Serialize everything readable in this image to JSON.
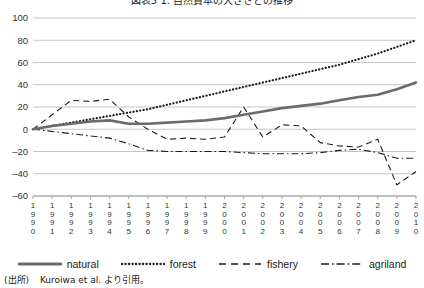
{
  "figure": {
    "title": "図表5  1. 自然資本の大きさとの推移",
    "source_label": "(出所)",
    "source_text": "Kuroiwa et al. より引用。"
  },
  "legend": {
    "position": "bottom",
    "items": [
      {
        "label": "natural",
        "style": "solid",
        "icon": "line-solid-icon"
      },
      {
        "label": "forest",
        "style": "dotted",
        "icon": "line-dotted-icon"
      },
      {
        "label": "fishery",
        "style": "dashed",
        "icon": "line-dashed-icon"
      },
      {
        "label": "agriland",
        "style": "dashdot",
        "icon": "line-dashdot-icon"
      }
    ]
  },
  "chart_data": {
    "type": "line",
    "title": "図表5  1. 自然資本の大きさとの推移",
    "xlabel": "",
    "ylabel": "",
    "ylim": [
      -60,
      100
    ],
    "yticks": [
      100,
      80,
      60,
      40,
      20,
      0,
      -20,
      -40,
      -60
    ],
    "grid": true,
    "legend_position": "bottom",
    "x": [
      1990,
      1991,
      1992,
      1993,
      1994,
      1995,
      1996,
      1997,
      1998,
      1999,
      2000,
      2001,
      2002,
      2003,
      2004,
      2005,
      2006,
      2007,
      2008,
      2009,
      2010
    ],
    "categories": [
      "1990",
      "1991",
      "1992",
      "1993",
      "1994",
      "1995",
      "1996",
      "1997",
      "1998",
      "1999",
      "2000",
      "2001",
      "2002",
      "2003",
      "2004",
      "2005",
      "2006",
      "2007",
      "2008",
      "2009",
      "2010"
    ],
    "series": [
      {
        "name": "natural",
        "values": [
          0,
          3,
          5,
          7,
          8,
          5,
          5,
          6,
          7,
          8,
          10,
          13,
          16,
          19,
          21,
          23,
          26,
          29,
          31,
          36,
          42
        ]
      },
      {
        "name": "forest",
        "values": [
          0,
          3,
          6,
          9,
          12,
          15,
          18,
          22,
          26,
          30,
          34,
          38,
          42,
          46,
          50,
          54,
          58,
          63,
          68,
          74,
          80
        ]
      },
      {
        "name": "fishery",
        "values": [
          0,
          13,
          26,
          25,
          27,
          11,
          0,
          -9,
          -8,
          -9,
          -7,
          20,
          -7,
          4,
          3,
          -12,
          -15,
          -16,
          -9,
          -50,
          -38
        ]
      },
      {
        "name": "agriland",
        "values": [
          0,
          -2,
          -4,
          -6,
          -8,
          -13,
          -19,
          -20,
          -20,
          -20,
          -20,
          -21,
          -22,
          -22,
          -22,
          -21,
          -19,
          -18,
          -21,
          -26,
          -26
        ]
      }
    ]
  }
}
